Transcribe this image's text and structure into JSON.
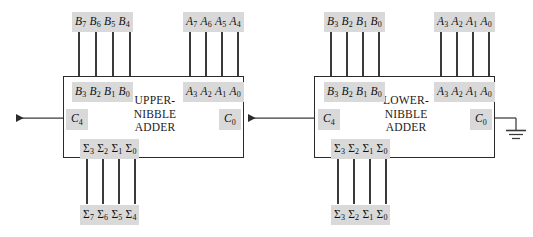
{
  "diagram": {
    "colors": {
      "label_background": "#d9d9d9",
      "wire": "#3a3a3a",
      "box_border": "#2b2b2b",
      "text": "#111111",
      "page_background": "#ffffff"
    },
    "blocks": [
      {
        "id": "upper",
        "title_lines": [
          "UPPER-",
          "NIBBLE",
          "ADDER"
        ],
        "b_inputs": {
          "text": "B3 B2 B1 B0",
          "bits": [
            "B3",
            "B2",
            "B1",
            "B0"
          ]
        },
        "a_inputs": {
          "text": "A3 A2 A1 A0",
          "bits": [
            "A3",
            "A2",
            "A1",
            "A0"
          ]
        },
        "carry_out": "C4",
        "carry_in": "C0",
        "sum_outputs": {
          "text": "S3 S2 S1 S0",
          "bits": [
            "Σ3",
            "Σ2",
            "Σ1",
            "Σ0"
          ]
        }
      },
      {
        "id": "lower",
        "title_lines": [
          "LOWER-",
          "NIBBLE",
          "ADDER"
        ],
        "b_inputs": {
          "text": "B3 B2 B1 B0",
          "bits": [
            "B3",
            "B2",
            "B1",
            "B0"
          ]
        },
        "a_inputs": {
          "text": "A3 A2 A1 A0",
          "bits": [
            "A3",
            "A2",
            "A1",
            "A0"
          ]
        },
        "carry_out": "C4",
        "carry_in": "C0",
        "sum_outputs": {
          "text": "S3 S2 S1 S0",
          "bits": [
            "Σ3",
            "Σ2",
            "Σ1",
            "Σ0"
          ]
        }
      }
    ],
    "external_inputs": [
      {
        "id": "upper-b",
        "bits": [
          "B7",
          "B6",
          "B5",
          "B4"
        ]
      },
      {
        "id": "upper-a",
        "bits": [
          "A7",
          "A6",
          "A5",
          "A4"
        ]
      },
      {
        "id": "lower-b",
        "bits": [
          "B3",
          "B2",
          "B1",
          "B0"
        ]
      },
      {
        "id": "lower-a",
        "bits": [
          "A3",
          "A2",
          "A1",
          "A0"
        ]
      }
    ],
    "external_outputs": [
      {
        "id": "upper-sum",
        "bits": [
          "Σ7",
          "Σ6",
          "Σ5",
          "Σ4"
        ]
      },
      {
        "id": "lower-sum",
        "bits": [
          "Σ3",
          "Σ2",
          "Σ1",
          "Σ0"
        ]
      }
    ],
    "ground_symbol": "ground-icon",
    "carry_chain_note": "C4 of lower-nibble adder feeds C0 of upper-nibble adder"
  }
}
